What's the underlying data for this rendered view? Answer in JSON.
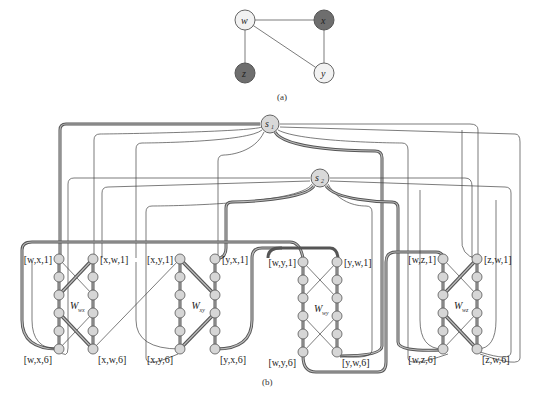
{
  "figure": {
    "part_a": {
      "caption": "(a)",
      "vertices": [
        {
          "id": "w",
          "label": "w",
          "x": 245,
          "y": 20,
          "fill": "#f2f2f2"
        },
        {
          "id": "x",
          "label": "x",
          "x": 324,
          "y": 20,
          "fill": "#6e6e6e"
        },
        {
          "id": "z",
          "label": "z",
          "x": 271,
          "y": 73,
          "fill": "#6e6e6e"
        },
        {
          "id": "y",
          "label": "y",
          "x": 324,
          "y": 73,
          "fill": "#f2f2f2"
        }
      ],
      "edges": [
        [
          "w",
          "x"
        ],
        [
          "w",
          "z"
        ],
        [
          "w",
          "y"
        ],
        [
          "x",
          "y"
        ]
      ]
    },
    "part_b": {
      "caption": "(b)",
      "sources": [
        {
          "id": "s1",
          "label": "s",
          "sub": "1",
          "x": 270,
          "y": 124
        },
        {
          "id": "s2",
          "label": "s",
          "sub": "2",
          "x": 320,
          "y": 178
        }
      ],
      "gadgets": [
        {
          "id": "W_wx",
          "label": "W",
          "sub": "wx",
          "left_x": 59,
          "right_x": 93,
          "top_left": "[w,x,1]",
          "top_right": "[x,w,1]",
          "bottom_left": "[w,x,6]",
          "bottom_right": "[x,w,6]"
        },
        {
          "id": "W_xy",
          "label": "W",
          "sub": "xy",
          "left_x": 180,
          "right_x": 215,
          "top_left": "[x,y,1]",
          "top_right": "[y,x,1]",
          "bottom_left": "[x,y,6]",
          "bottom_right": "[y,x,6]"
        },
        {
          "id": "W_wy",
          "label": "W",
          "sub": "wy",
          "left_x": 303,
          "right_x": 337,
          "top_left": "[w,y,1]",
          "top_right": "[y,w,1]",
          "bottom_left": "[w,y,6]",
          "bottom_right": "[y,w,6]"
        },
        {
          "id": "W_wz",
          "label": "W",
          "sub": "wz",
          "left_x": 443,
          "right_x": 477,
          "top_left": "[w,z,1]",
          "top_right": "[z,w,1]",
          "bottom_left": "[w,z,6]",
          "bottom_right": "[z,w,6]"
        }
      ],
      "rows_per_column": 6
    }
  }
}
